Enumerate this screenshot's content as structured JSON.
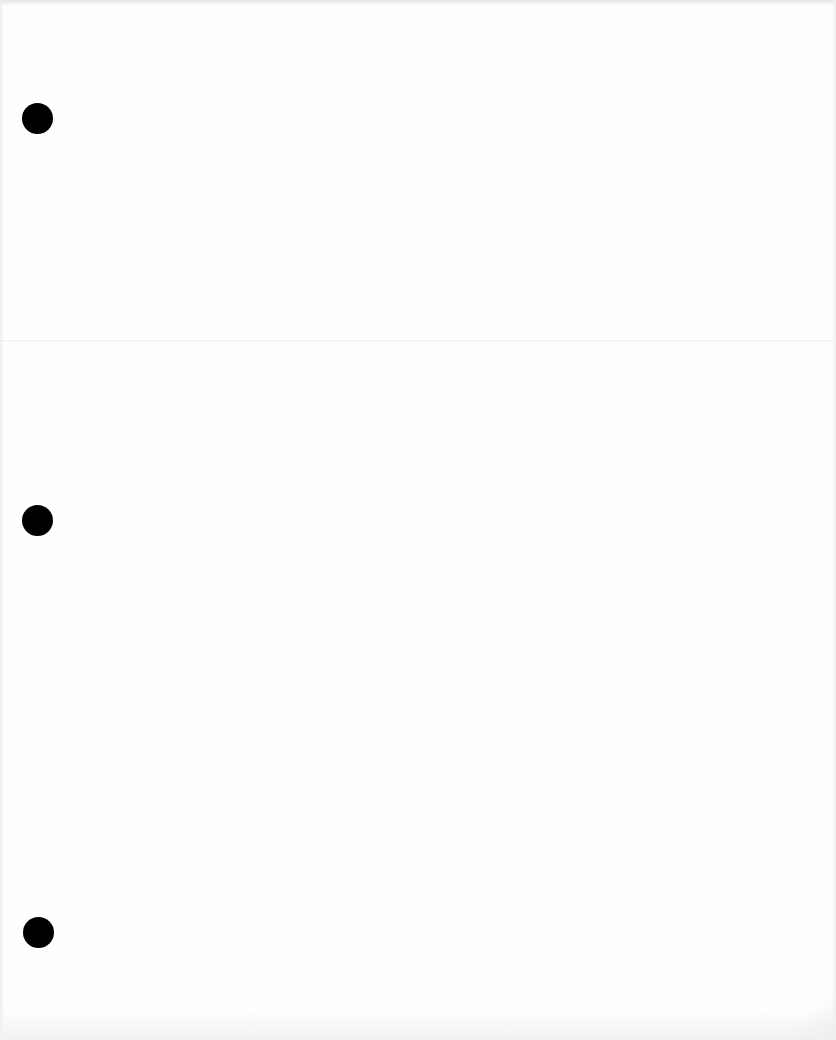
{
  "page": {
    "type": "blank-sheet",
    "background_color": "#fefefe",
    "text_content": []
  },
  "punch_holes": [
    {
      "cx": 37,
      "cy": 118,
      "r": 15,
      "color": "#000000"
    },
    {
      "cx": 37,
      "cy": 520,
      "r": 15,
      "color": "#000000"
    },
    {
      "cx": 38,
      "cy": 932,
      "r": 15,
      "color": "#000000"
    }
  ]
}
